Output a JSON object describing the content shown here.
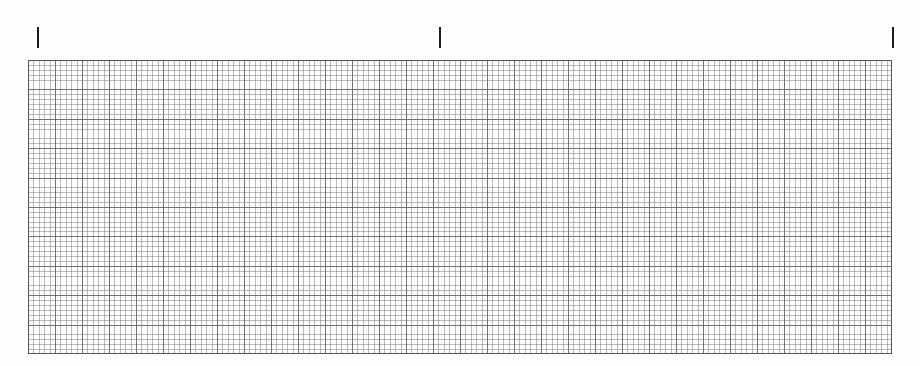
{
  "document": {
    "kind": "graph-paper-scan",
    "title": "Scanned graph paper sheet",
    "background_color": "#fefefe",
    "width_px": 920,
    "height_px": 366
  },
  "tick_marks": {
    "label": "alignment tick marks",
    "color": "#1d1d1d",
    "top_px": 27,
    "height_px": 21,
    "width_px": 2,
    "items": [
      {
        "name": "tick-left",
        "x_px": 37
      },
      {
        "name": "tick-center",
        "x_px": 439
      },
      {
        "name": "tick-right",
        "x_px": 892
      }
    ]
  },
  "grid": {
    "label": "graph paper grid block",
    "left_px": 28,
    "top_px": 60,
    "width_px": 864,
    "height_px": 294,
    "minor_cell_width_px": 5.4,
    "minor_cell_height_px": 4.9,
    "major_cell_width_px": 27.0,
    "major_cell_height_px": 29.4,
    "minor_columns": 160,
    "minor_rows": 60,
    "major_columns": 32,
    "major_rows": 10,
    "minor_line_color": "#787880",
    "major_line_color": "#5f5f64",
    "border_color": "#55555a",
    "paper_color": "#fdfdfd"
  },
  "chart_data": {
    "type": "table",
    "xlabel": "",
    "ylabel": "",
    "categories": [],
    "values": [],
    "annotations": [
      "Three short vertical tick marks sit above the grid block.",
      "The grid is empty — no curve, points, or labels are drawn on it."
    ],
    "grid": true,
    "legend": "none"
  }
}
